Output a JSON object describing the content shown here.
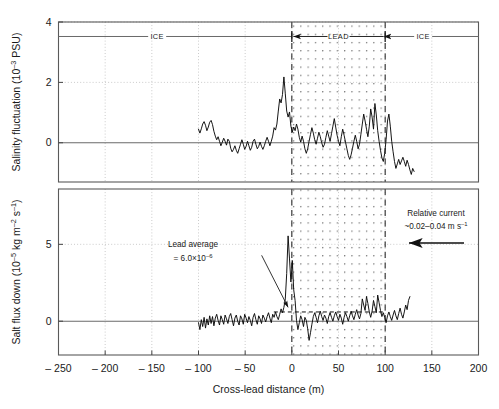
{
  "figure": {
    "background": "#ffffff",
    "line_color": "#000000",
    "axis_color": "#555555",
    "grid_color": "#b9b9b9"
  },
  "chart_data": {
    "type": "line",
    "title": "",
    "subtitle": "",
    "panels": [
      {
        "id": "salinity",
        "ylabel": "Salinity fluctuation (10⁻³ PSU)",
        "ylabel_parts": {
          "base": "Salinity fluctuation (10",
          "exp": "–3",
          "tail": " PSU)"
        },
        "ylim": [
          -1.3,
          4.0
        ],
        "yticks": [
          0,
          2,
          4
        ],
        "ytick_labels": [
          "0",
          "2",
          "4"
        ],
        "grid": true,
        "zero_line": true,
        "series_name": "salinity fluctuation",
        "x": [
          -100,
          -98.5,
          -97,
          -95.5,
          -94,
          -92.5,
          -91,
          -89.5,
          -88,
          -86.5,
          -85,
          -83.5,
          -82,
          -80.5,
          -79,
          -77.5,
          -76,
          -74.5,
          -73,
          -71.5,
          -70,
          -68.5,
          -67,
          -65.5,
          -64,
          -62.5,
          -61,
          -59.5,
          -58,
          -56.5,
          -55,
          -53.5,
          -52,
          -50.5,
          -49,
          -47.5,
          -46,
          -44.5,
          -43,
          -41.5,
          -40,
          -38.5,
          -37,
          -35.5,
          -34,
          -32.5,
          -31,
          -29.5,
          -28,
          -26.5,
          -25,
          -23.5,
          -22,
          -20.5,
          -19,
          -17.5,
          -16,
          -14.5,
          -13,
          -11.5,
          -10,
          -8.5,
          -7,
          -5.5,
          -4,
          -2.5,
          -1,
          0.5,
          2,
          3.5,
          5,
          6.5,
          8,
          9.5,
          11,
          12.5,
          14,
          15.5,
          17,
          18.5,
          20,
          21.5,
          23,
          24.5,
          26,
          27.5,
          29,
          30.5,
          32,
          33.5,
          35,
          36.5,
          38,
          39.5,
          41,
          42.5,
          44,
          45.5,
          47,
          48.5,
          50,
          51.5,
          53,
          54.5,
          56,
          57.5,
          59,
          60.5,
          62,
          63.5,
          65,
          66.5,
          68,
          69.5,
          71,
          72.5,
          74,
          75.5,
          77,
          78.5,
          80,
          81.5,
          83,
          84.5,
          86,
          87.5,
          89,
          90.5,
          92,
          93.5,
          95,
          96.5,
          98,
          99.5,
          101,
          102.5,
          104,
          105.5,
          107,
          108.5,
          110,
          111.5,
          113,
          114.5,
          116,
          117.5,
          119,
          120.5,
          122,
          123.5,
          125,
          126.5,
          128,
          129.5,
          131
        ],
        "y": [
          0.45,
          0.32,
          0.46,
          0.62,
          0.7,
          0.58,
          0.4,
          0.52,
          0.68,
          0.74,
          0.6,
          0.38,
          0.22,
          0.1,
          0.2,
          0.05,
          -0.1,
          0.02,
          0.15,
          0.05,
          -0.08,
          0.12,
          0.05,
          -0.18,
          -0.3,
          -0.22,
          -0.1,
          -0.25,
          -0.35,
          -0.2,
          -0.05,
          0.1,
          -0.05,
          -0.22,
          -0.12,
          0.05,
          -0.1,
          -0.25,
          -0.15,
          0.05,
          0.12,
          -0.05,
          -0.2,
          -0.12,
          0.02,
          -0.12,
          -0.22,
          -0.1,
          0.05,
          0.18,
          0.05,
          -0.1,
          0.05,
          0.22,
          0.5,
          0.42,
          0.62,
          1.05,
          1.45,
          1.32,
          1.6,
          2.18,
          1.62,
          1.05,
          0.85,
          1.02,
          0.55,
          0.35,
          0.52,
          0.4,
          0.62,
          0.45,
          0.18,
          0.02,
          0.22,
          0.05,
          -0.2,
          -0.35,
          -0.2,
          0.05,
          0.28,
          0.5,
          0.32,
          0.1,
          -0.05,
          0.15,
          0.35,
          0.2,
          0.0,
          -0.15,
          -0.05,
          0.18,
          0.4,
          0.22,
          0.05,
          0.3,
          0.55,
          0.8,
          0.52,
          0.25,
          0.05,
          -0.1,
          0.2,
          0.45,
          0.25,
          0.02,
          -0.2,
          -0.42,
          -0.55,
          -0.4,
          -0.18,
          0.05,
          0.25,
          0.05,
          -0.2,
          -0.05,
          0.28,
          0.62,
          0.95,
          0.72,
          0.45,
          0.2,
          0.55,
          1.12,
          0.85,
          0.45,
          1.3,
          0.92,
          0.4,
          0.05,
          -0.25,
          -0.5,
          -0.62,
          -0.35,
          0.1,
          0.72,
          0.95,
          0.55,
          0.05,
          -0.3,
          -0.62,
          -0.85,
          -0.7,
          -0.55,
          -0.72,
          -0.6,
          -0.48,
          -0.62,
          -0.78,
          -0.58,
          -0.72,
          -0.9,
          -1.05,
          -0.85,
          -0.95,
          -1.12
        ],
        "region_markers": {
          "left_label": "ICE",
          "center_label": "LEAD",
          "right_label": "ICE",
          "marker_y": 3.52,
          "lead_start": 0,
          "lead_end": 100
        }
      },
      {
        "id": "saltflux",
        "ylabel": "Salt flux down (10⁻⁵ kg m⁻² s⁻¹)",
        "ylabel_parts": {
          "base": "Salt flux down (10",
          "exp": "–5",
          "mid": " kg m",
          "exp2": "–2",
          "mid2": " s",
          "exp3": "–1",
          "tail": ")"
        },
        "ylim": [
          -2.2,
          8.6
        ],
        "yticks": [
          0,
          5
        ],
        "ytick_labels": [
          "0",
          "5"
        ],
        "grid": true,
        "zero_line": true,
        "series_name": "salt flux down",
        "lead_average_value": 0.6,
        "x": [
          -100,
          -98.5,
          -97,
          -95.5,
          -94,
          -92.5,
          -91,
          -89.5,
          -88,
          -86.5,
          -85,
          -83.5,
          -82,
          -80.5,
          -79,
          -77.5,
          -76,
          -74.5,
          -73,
          -71.5,
          -70,
          -68.5,
          -67,
          -65.5,
          -64,
          -62.5,
          -61,
          -59.5,
          -58,
          -56.5,
          -55,
          -53.5,
          -52,
          -50.5,
          -49,
          -47.5,
          -46,
          -44.5,
          -43,
          -41.5,
          -40,
          -38.5,
          -37,
          -35.5,
          -34,
          -32.5,
          -31,
          -29.5,
          -28,
          -26.5,
          -25,
          -23.5,
          -22,
          -20.5,
          -19,
          -17.5,
          -16,
          -14.5,
          -13,
          -11.5,
          -10,
          -8.5,
          -7,
          -5.5,
          -4,
          -2.5,
          -1,
          0.5,
          2,
          3.5,
          5,
          6.5,
          8,
          9.5,
          11,
          12.5,
          14,
          15.5,
          17,
          18.5,
          20,
          21.5,
          23,
          24.5,
          26,
          27.5,
          29,
          30.5,
          32,
          33.5,
          35,
          36.5,
          38,
          39.5,
          41,
          42.5,
          44,
          45.5,
          47,
          48.5,
          50,
          51.5,
          53,
          54.5,
          56,
          57.5,
          59,
          60.5,
          62,
          63.5,
          65,
          66.5,
          68,
          69.5,
          71,
          72.5,
          74,
          75.5,
          77,
          78.5,
          80,
          81.5,
          83,
          84.5,
          86,
          87.5,
          89,
          90.5,
          92,
          93.5,
          95,
          96.5,
          98,
          99.5,
          101,
          102.5,
          104,
          105.5,
          107,
          108.5,
          110,
          111.5,
          113,
          114.5,
          116,
          117.5,
          119,
          120.5,
          122,
          123.5,
          125,
          126.5,
          128,
          129.5,
          131
        ],
        "y": [
          -0.1,
          -0.55,
          0.1,
          -0.35,
          0.25,
          -0.45,
          0.15,
          -0.25,
          0.35,
          -0.15,
          0.3,
          -0.3,
          0.2,
          0.45,
          0.05,
          -0.25,
          0.35,
          0.1,
          -0.2,
          0.4,
          0.15,
          -0.15,
          0.3,
          0.5,
          0.1,
          -0.3,
          0.2,
          0.4,
          0.0,
          -0.25,
          0.35,
          0.15,
          -0.2,
          0.45,
          0.2,
          -0.1,
          0.3,
          0.05,
          -0.3,
          0.25,
          0.5,
          0.1,
          -0.2,
          0.35,
          0.15,
          -0.15,
          0.4,
          0.2,
          -0.05,
          0.3,
          0.55,
          0.2,
          -0.1,
          0.45,
          0.25,
          0.6,
          0.3,
          0.1,
          0.45,
          0.8,
          0.55,
          0.9,
          1.45,
          3.1,
          5.55,
          4.05,
          2.55,
          3.95,
          2.05,
          1.35,
          0.05,
          -0.55,
          -0.1,
          0.35,
          0.1,
          -0.35,
          0.25,
          0.05,
          -0.5,
          -1.25,
          -0.75,
          -0.2,
          0.3,
          0.55,
          0.25,
          -0.1,
          0.35,
          0.65,
          0.3,
          0.05,
          0.4,
          0.2,
          -0.15,
          0.3,
          0.55,
          0.25,
          0.0,
          0.35,
          0.6,
          0.3,
          0.05,
          0.45,
          0.2,
          -0.2,
          0.25,
          0.55,
          0.3,
          0.0,
          0.35,
          0.65,
          0.35,
          0.1,
          0.45,
          0.75,
          0.4,
          0.15,
          0.5,
          1.45,
          1.05,
          0.7,
          1.6,
          1.15,
          0.6,
          0.25,
          0.65,
          1.35,
          0.95,
          0.55,
          1.7,
          1.2,
          0.7,
          0.3,
          0.55,
          0.25,
          -0.1,
          0.35,
          0.6,
          0.3,
          0.05,
          0.4,
          0.7,
          0.35,
          0.1,
          0.5,
          0.85,
          0.45,
          0.2,
          0.6,
          1.05,
          0.75,
          1.35,
          1.6
        ],
        "annotations": [
          {
            "id": "lead-average",
            "line1": "Lead average",
            "line2_prefix": "= 6.0×10",
            "line2_exp": "–6",
            "leader_from": [
              -42,
              5.0
            ],
            "leader_to": [
              -4,
              0.9
            ]
          },
          {
            "id": "relative-current",
            "line1": "Relative current",
            "line2_prefix": "~0.02–0.04 m s",
            "line2_exp": "–1",
            "arrow_direction": "left"
          }
        ]
      }
    ],
    "xlabel": "Cross-lead distance (m)",
    "xlim": [
      -250,
      200
    ],
    "xticks": [
      -250,
      -200,
      -150,
      -100,
      -50,
      0,
      50,
      100,
      150,
      200
    ],
    "xtick_labels": [
      "– 250",
      "– 200",
      "– 150",
      "– 100",
      "– 50",
      "0",
      "50",
      "100",
      "150",
      "200"
    ],
    "lead_region": {
      "start": 0,
      "end": 100,
      "fill": "stipple",
      "border": "dashed"
    }
  }
}
